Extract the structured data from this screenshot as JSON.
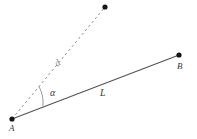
{
  "figure": {
    "type": "geometry-diagram",
    "background_color": "#ffffff",
    "solid_line_color": "#555555",
    "dashed_line_color": "#999999",
    "point_color": "#1a1a1a",
    "label_color": "#3a3a3a"
  },
  "points": [
    {
      "id": "A",
      "label": "A",
      "x": 12,
      "y": 119
    },
    {
      "id": "B",
      "label": "B",
      "x": 179,
      "y": 55
    },
    {
      "id": "D",
      "label": "",
      "x": 105,
      "y": 7
    }
  ],
  "segments": [
    {
      "id": "AB",
      "label": "L",
      "style": "solid",
      "from": "A",
      "to": "B",
      "color": "#555555",
      "width": 1.2
    },
    {
      "id": "AD",
      "label": "d",
      "style": "dashed",
      "from": "A",
      "to": "D",
      "color": "#999999",
      "width": 1
    }
  ],
  "angle": {
    "label": "α",
    "vertex": "A",
    "between": [
      "AD",
      "AB"
    ],
    "arc_radius": 33
  }
}
